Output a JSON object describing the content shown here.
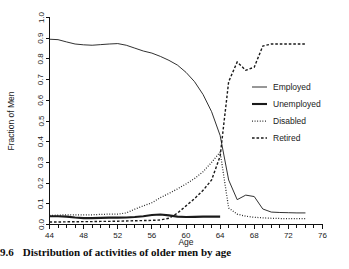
{
  "caption": {
    "number": "9.6",
    "text": "Distribution of activities of older men by age"
  },
  "chart_data": {
    "type": "line",
    "title": "",
    "xlabel": "Age",
    "ylabel": "Fraction of Men",
    "xlim": [
      44,
      76
    ],
    "ylim": [
      0.0,
      1.0
    ],
    "grid": false,
    "legend_position": "right",
    "xticks": [
      44,
      48,
      52,
      56,
      60,
      64,
      68,
      72,
      76
    ],
    "xtick_labels": [
      "44",
      "48",
      "52",
      "56",
      "60",
      "64",
      "68",
      "72",
      "76"
    ],
    "xtick_minor_step": 1,
    "yticks": [
      0.0,
      0.1,
      0.2,
      0.3,
      0.4,
      0.5,
      0.6,
      0.7,
      0.8,
      0.9,
      1.0
    ],
    "ytick_labels": [
      "0.0",
      "0.1",
      "0.2",
      "0.3",
      "0.4",
      "0.5",
      "0.6",
      "0.7",
      "0.8",
      "0.9",
      "1.0"
    ],
    "x": [
      44,
      45,
      46,
      47,
      48,
      49,
      50,
      51,
      52,
      53,
      54,
      55,
      56,
      57,
      58,
      59,
      60,
      61,
      62,
      63,
      64,
      65,
      66,
      67,
      68,
      69,
      70,
      71,
      72,
      73,
      74
    ],
    "series": [
      {
        "name": "Employed",
        "style": "solid-thin",
        "color": "#1a1a1a",
        "values": [
          0.895,
          0.893,
          0.882,
          0.872,
          0.868,
          0.866,
          0.869,
          0.872,
          0.874,
          0.866,
          0.852,
          0.838,
          0.828,
          0.812,
          0.793,
          0.77,
          0.735,
          0.69,
          0.628,
          0.545,
          0.43,
          0.215,
          0.12,
          0.142,
          0.135,
          0.075,
          0.06,
          0.058,
          0.057,
          0.056,
          0.056
        ]
      },
      {
        "name": "Unemployed",
        "style": "solid-thick",
        "color": "#1a1a1a",
        "values": [
          0.04,
          0.04,
          0.038,
          0.034,
          0.031,
          0.031,
          0.032,
          0.033,
          0.033,
          0.034,
          0.036,
          0.04,
          0.046,
          0.048,
          0.044,
          0.038,
          0.036,
          0.037,
          0.038,
          0.038,
          0.038,
          null,
          null,
          null,
          null,
          null,
          null,
          null,
          null,
          null,
          null
        ]
      },
      {
        "name": "Disabled",
        "style": "dotted",
        "color": "#1a1a1a",
        "values": [
          0.044,
          0.045,
          0.047,
          0.046,
          0.046,
          0.047,
          0.049,
          0.05,
          0.05,
          0.056,
          0.074,
          0.09,
          0.105,
          0.13,
          0.15,
          0.172,
          0.196,
          0.222,
          0.255,
          0.3,
          0.35,
          0.08,
          0.05,
          0.04,
          0.035,
          0.032,
          0.03,
          0.029,
          0.029,
          0.028,
          0.028
        ]
      },
      {
        "name": "Retired",
        "style": "dashed",
        "color": "#1a1a1a",
        "values": [
          0.012,
          0.012,
          0.013,
          0.013,
          0.014,
          0.014,
          0.015,
          0.015,
          0.016,
          0.017,
          0.018,
          0.019,
          0.02,
          0.022,
          0.03,
          0.055,
          0.09,
          0.125,
          0.165,
          0.215,
          0.33,
          0.69,
          0.785,
          0.745,
          0.76,
          0.862,
          0.872,
          0.872,
          0.872,
          0.872,
          0.872
        ]
      }
    ]
  },
  "legend": {
    "items": [
      {
        "label": "Employed",
        "style": "solid-thin"
      },
      {
        "label": "Unemployed",
        "style": "solid-thick"
      },
      {
        "label": "Disabled",
        "style": "dotted"
      },
      {
        "label": "Retired",
        "style": "dashed"
      }
    ]
  }
}
